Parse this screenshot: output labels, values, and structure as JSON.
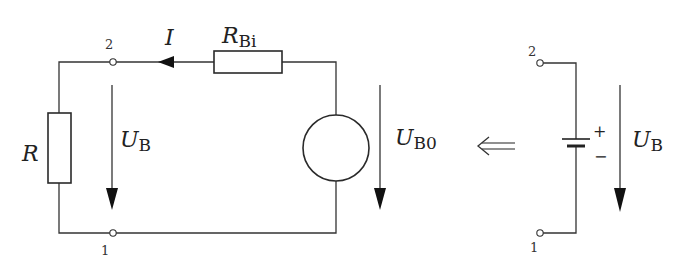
{
  "diagram": {
    "type": "circuit-schematic",
    "left_circuit": {
      "current_label": "I",
      "internal_resistor": {
        "symbol": "R",
        "subscript": "Bi"
      },
      "load_resistor": {
        "symbol": "R"
      },
      "terminal_voltage": {
        "symbol": "U",
        "subscript": "B"
      },
      "source_voltage": {
        "symbol": "U",
        "subscript": "B0"
      },
      "terminals": {
        "top": "2",
        "bottom": "1"
      }
    },
    "equivalence_arrow": "⇐",
    "right_circuit": {
      "battery_plus": "+",
      "battery_minus": "−",
      "terminal_voltage": {
        "symbol": "U",
        "subscript": "B"
      },
      "terminals": {
        "top": "2",
        "bottom": "1"
      }
    }
  }
}
